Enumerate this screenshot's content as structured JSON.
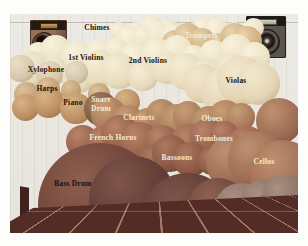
{
  "scene": {
    "wall_color": "#eceae4",
    "floor_color": "#542c26",
    "floor_grid_line_color": "#ebb4a0",
    "dark_label_color": "#241309",
    "light_label_color": "#f2ead6"
  },
  "icons": {
    "left_speaker": "speaker-icon",
    "right_speaker": "speaker-icon"
  },
  "clouds": [
    {
      "id": "back-row",
      "x": 100,
      "y": 6,
      "w": 150,
      "h": 22,
      "c": "#ebe2c6",
      "hl": "#f8f2e0",
      "sh": "#c6b592",
      "n": 9
    },
    {
      "id": "flutes",
      "x": 110,
      "y": 10,
      "w": 62,
      "h": 24,
      "c": "#ede4c8",
      "hl": "#f8f2e0",
      "sh": "#c6b592",
      "n": 4
    },
    {
      "id": "trumpets",
      "x": 156,
      "y": 14,
      "w": 90,
      "h": 26,
      "c": "#d0ae80",
      "hl": "#e9d4ae",
      "sh": "#a07c54",
      "n": 6
    },
    {
      "id": "first-violins",
      "x": 18,
      "y": 26,
      "w": 236,
      "h": 28,
      "c": "#ece2c4",
      "hl": "#f8f2de",
      "sh": "#c2b08c",
      "n": 12
    },
    {
      "id": "second-violins",
      "x": 12,
      "y": 42,
      "w": 242,
      "h": 32,
      "c": "#e7dbbc",
      "hl": "#f5edd6",
      "sh": "#bcaa84",
      "n": 11
    },
    {
      "id": "xylophone",
      "x": 0,
      "y": 46,
      "w": 78,
      "h": 24,
      "c": "#d4c6aa",
      "hl": "#e9dfc8",
      "sh": "#a8986f",
      "n": 3
    },
    {
      "id": "violas",
      "x": 184,
      "y": 50,
      "w": 76,
      "h": 42,
      "c": "#e4d4b4",
      "hl": "#f3e8cf",
      "sh": "#b5a078",
      "n": 4
    },
    {
      "id": "right-sphere",
      "x": 246,
      "y": 84,
      "w": 46,
      "h": 46,
      "c": "#9c6b53",
      "hl": "#bf9070",
      "sh": "#6e4433",
      "n": 1
    },
    {
      "id": "harps",
      "x": 2,
      "y": 66,
      "w": 98,
      "h": 22,
      "c": "#c4a074",
      "hl": "#ddc09a",
      "sh": "#99744c",
      "n": 4
    },
    {
      "id": "piano",
      "x": 2,
      "y": 78,
      "w": 128,
      "h": 28,
      "c": "#bc8e62",
      "hl": "#d8b488",
      "sh": "#8f653e",
      "n": 5
    },
    {
      "id": "snare-drum",
      "x": 74,
      "y": 78,
      "w": 34,
      "h": 34,
      "c": "#7d5a40",
      "hl": "#a5825f",
      "sh": "#54371e",
      "n": 1
    },
    {
      "id": "clarinets",
      "x": 92,
      "y": 90,
      "w": 86,
      "h": 30,
      "c": "#a97b59",
      "hl": "#c79e78",
      "sh": "#7c5034",
      "n": 5
    },
    {
      "id": "oboes",
      "x": 170,
      "y": 90,
      "w": 72,
      "h": 30,
      "c": "#a97b59",
      "hl": "#c79e78",
      "sh": "#7c5034",
      "n": 4
    },
    {
      "id": "french-horns",
      "x": 62,
      "y": 108,
      "w": 98,
      "h": 34,
      "c": "#96604b",
      "hl": "#b98469",
      "sh": "#6c3e2e",
      "n": 5
    },
    {
      "id": "trombones",
      "x": 168,
      "y": 108,
      "w": 78,
      "h": 34,
      "c": "#96604b",
      "hl": "#b98469",
      "sh": "#6c3e2e",
      "n": 4
    },
    {
      "id": "bassoons",
      "x": 134,
      "y": 128,
      "w": 76,
      "h": 32,
      "c": "#8a5744",
      "hl": "#ab7a5e",
      "sh": "#5e3425",
      "n": 4
    },
    {
      "id": "cellos",
      "x": 212,
      "y": 122,
      "w": 72,
      "h": 58,
      "c": "#9c6b53",
      "hl": "#bf9070",
      "sh": "#6e4433",
      "n": 3
    },
    {
      "id": "bass-drum",
      "x": 28,
      "y": 129,
      "w": 124,
      "h": 124,
      "c": "#6b4037",
      "hl": "#8d5f4e",
      "sh": "#45231d",
      "n": 1
    },
    {
      "id": "timpani",
      "x": 98,
      "y": 154,
      "w": 104,
      "h": 80,
      "c": "#5f3a33",
      "hl": "#7e554b",
      "sh": "#3c211c",
      "n": 2
    },
    {
      "id": "tuba",
      "x": 178,
      "y": 164,
      "w": 60,
      "h": 60,
      "c": "#6d463c",
      "hl": "#8d6152",
      "sh": "#47281f",
      "n": 1
    },
    {
      "id": "bass-violins",
      "x": 218,
      "y": 166,
      "w": 70,
      "h": 48,
      "c": "#887064",
      "hl": "#a89183",
      "sh": "#5c483e",
      "n": 3
    }
  ],
  "labels": [
    {
      "id": "chimes",
      "text": "Chimes",
      "x": 87,
      "y": 14,
      "color": "#241309"
    },
    {
      "id": "flutes",
      "text": "Flutes",
      "x": 136,
      "y": 16,
      "color": "#f2ead6"
    },
    {
      "id": "trumpets",
      "text": "Trumpets",
      "x": 191,
      "y": 22,
      "color": "#f2ead6"
    },
    {
      "id": "first-violins",
      "text": "1st Violins",
      "x": 76,
      "y": 44,
      "color": "#241309"
    },
    {
      "id": "second-violins",
      "text": "2nd Violins",
      "x": 138,
      "y": 47,
      "color": "#241309"
    },
    {
      "id": "xylophone",
      "text": "Xylophone",
      "x": 36,
      "y": 56,
      "color": "#241309"
    },
    {
      "id": "violas",
      "text": "Violas",
      "x": 226,
      "y": 67,
      "color": "#241309"
    },
    {
      "id": "harps",
      "text": "Harps",
      "x": 37,
      "y": 75,
      "color": "#241309"
    },
    {
      "id": "piano",
      "text": "Piano",
      "x": 63,
      "y": 89,
      "color": "#241309"
    },
    {
      "id": "snare-drum",
      "text": "Snare\nDrum",
      "x": 91,
      "y": 91,
      "color": "#f2ead6"
    },
    {
      "id": "clarinets",
      "text": "Clarinets",
      "x": 129,
      "y": 104,
      "color": "#f2ead6"
    },
    {
      "id": "oboes",
      "text": "Oboes",
      "x": 202,
      "y": 105,
      "color": "#f2ead6"
    },
    {
      "id": "french-horns",
      "text": "French Horns",
      "x": 103,
      "y": 124,
      "color": "#f2ead6"
    },
    {
      "id": "trombones",
      "text": "Trombones",
      "x": 204,
      "y": 125,
      "color": "#f2ead6"
    },
    {
      "id": "bassoons",
      "text": "Bassoons",
      "x": 167,
      "y": 144,
      "color": "#f2ead6"
    },
    {
      "id": "cellos",
      "text": "Cellos",
      "x": 254,
      "y": 148,
      "color": "#f2ead6"
    },
    {
      "id": "bass-drum",
      "text": "Bass Drum",
      "x": 63,
      "y": 170,
      "color": "#1d1008"
    },
    {
      "id": "timpani",
      "text": "Timpani",
      "x": 140,
      "y": 198,
      "color": "#f2ead6"
    },
    {
      "id": "tuba",
      "text": "Tuba",
      "x": 203,
      "y": 190,
      "color": "#f2ead6"
    },
    {
      "id": "bass-violins",
      "text": "Bass Violins",
      "x": 252,
      "y": 194,
      "color": "#f2ead6"
    }
  ]
}
